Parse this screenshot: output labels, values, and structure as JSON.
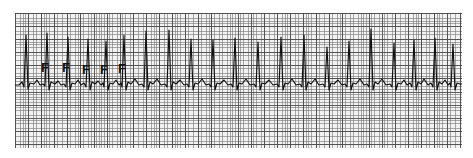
{
  "figure": {
    "kind": "ecg-rhythm-strip",
    "lead_label": "",
    "paper": {
      "left": 15,
      "top": 13,
      "width": 447,
      "height": 135,
      "background_color": "#f2f2f2",
      "fine_grid_color": "#787878",
      "bold_grid_color": "#464646",
      "fine_grid_spacing_px": 2.62,
      "bold_grid_spacing_px": 13.1,
      "trace_color": "#111111",
      "page_background": "#ffffff"
    }
  },
  "annotations": {
    "label_text": "F",
    "meaning": "fusion beat",
    "marks": [
      {
        "label": "F",
        "x": 26,
        "y": 48
      },
      {
        "label": "F",
        "x": 47,
        "y": 48
      },
      {
        "label": "F",
        "x": 67,
        "y": 50
      },
      {
        "label": "F",
        "x": 85,
        "y": 50
      },
      {
        "label": "F",
        "x": 103,
        "y": 49
      }
    ]
  },
  "chart_data": {
    "type": "line",
    "xlabel": "",
    "ylabel": "",
    "grid": true,
    "legend_position": "none",
    "xlim": [
      0,
      447
    ],
    "ylim": [
      0,
      135
    ],
    "baseline_y": 71,
    "series": [
      {
        "name": "ECG trace",
        "color": "#111111",
        "beats": [
          {
            "index": 1,
            "r_peak_x": 11,
            "r_peak_y": 22,
            "annotation": ""
          },
          {
            "index": 2,
            "r_peak_x": 32,
            "r_peak_y": 20,
            "annotation": "F"
          },
          {
            "index": 3,
            "r_peak_x": 53,
            "r_peak_y": 24,
            "annotation": "F"
          },
          {
            "index": 4,
            "r_peak_x": 73,
            "r_peak_y": 26,
            "annotation": "F"
          },
          {
            "index": 5,
            "r_peak_x": 91,
            "r_peak_y": 28,
            "annotation": "F"
          },
          {
            "index": 6,
            "r_peak_x": 109,
            "r_peak_y": 22,
            "annotation": "F"
          },
          {
            "index": 7,
            "r_peak_x": 131,
            "r_peak_y": 18,
            "annotation": ""
          },
          {
            "index": 8,
            "r_peak_x": 154,
            "r_peak_y": 17,
            "annotation": ""
          },
          {
            "index": 9,
            "r_peak_x": 176,
            "r_peak_y": 26,
            "annotation": ""
          },
          {
            "index": 10,
            "r_peak_x": 198,
            "r_peak_y": 27,
            "annotation": ""
          },
          {
            "index": 11,
            "r_peak_x": 220,
            "r_peak_y": 25,
            "annotation": ""
          },
          {
            "index": 12,
            "r_peak_x": 243,
            "r_peak_y": 29,
            "annotation": ""
          },
          {
            "index": 13,
            "r_peak_x": 266,
            "r_peak_y": 24,
            "annotation": ""
          },
          {
            "index": 14,
            "r_peak_x": 289,
            "r_peak_y": 22,
            "annotation": ""
          },
          {
            "index": 15,
            "r_peak_x": 312,
            "r_peak_y": 34,
            "annotation": ""
          },
          {
            "index": 16,
            "r_peak_x": 334,
            "r_peak_y": 28,
            "annotation": ""
          },
          {
            "index": 17,
            "r_peak_x": 356,
            "r_peak_y": 16,
            "annotation": ""
          },
          {
            "index": 18,
            "r_peak_x": 379,
            "r_peak_y": 30,
            "annotation": ""
          },
          {
            "index": 19,
            "r_peak_x": 399,
            "r_peak_y": 27,
            "annotation": ""
          },
          {
            "index": 20,
            "r_peak_x": 420,
            "r_peak_y": 25,
            "annotation": ""
          },
          {
            "index": 21,
            "r_peak_x": 438,
            "r_peak_y": 31,
            "annotation": ""
          }
        ],
        "path": "M 0,72 L 4,72 L 7,69 L 9,74 L 11,22 L 13,76 L 15,70 L 19,71 L 22,67 L 25,72 L 28,71 L 30,73 L 32,20 L 34,77 L 36,69 L 40,71 L 43,68 L 46,72 L 49,71 L 51,74 L 53,24 L 55,77 L 57,70 L 60,71 L 63,67 L 66,72 L 69,70 L 71,74 L 73,26 L 75,77 L 77,69 L 80,71 L 83,68 L 86,72 L 88,70 L 89,74 L 91,28 L 93,77 L 95,70 L 98,71 L 101,67 L 104,72 L 106,70 L 107,74 L 109,22 L 111,77 L 113,69 L 116,71 L 120,66 L 124,72 L 127,71 L 129,74 L 131,18 L 133,77 L 135,69 L 138,71 L 142,66 L 146,72 L 150,71 L 152,74 L 154,17 L 156,77 L 158,69 L 161,71 L 165,67 L 169,72 L 172,71 L 174,74 L 176,26 L 178,77 L 180,70 L 183,71 L 187,66 L 191,72 L 194,71 L 196,74 L 198,27 L 200,77 L 202,70 L 205,71 L 209,67 L 213,72 L 216,71 L 218,74 L 220,25 L 222,77 L 224,70 L 227,71 L 231,66 L 235,72 L 239,71 L 241,74 L 243,29 L 245,77 L 247,70 L 250,71 L 254,67 L 258,72 L 262,71 L 264,74 L 266,24 L 268,77 L 270,70 L 273,71 L 277,66 L 281,72 L 285,71 L 287,74 L 289,22 L 291,77 L 293,69 L 296,71 L 300,66 L 304,72 L 308,71 L 310,74 L 312,34 L 314,77 L 316,70 L 319,71 L 323,67 L 327,72 L 330,71 L 332,74 L 334,28 L 336,77 L 338,70 L 341,71 L 345,66 L 349,72 L 352,71 L 354,74 L 356,16 L 358,77 L 360,69 L 363,71 L 367,66 L 371,72 L 375,71 L 377,74 L 379,30 L 381,77 L 383,70 L 386,71 L 389,67 L 392,72 L 395,70 L 397,74 L 399,27 L 401,77 L 403,69 L 406,71 L 409,66 L 413,72 L 416,70 L 418,74 L 420,25 L 422,77 L 424,69 L 427,71 L 430,67 L 433,72 L 435,70 L 436,74 L 438,31 L 440,77 L 442,70 L 445,71 L 447,71"
      }
    ]
  }
}
